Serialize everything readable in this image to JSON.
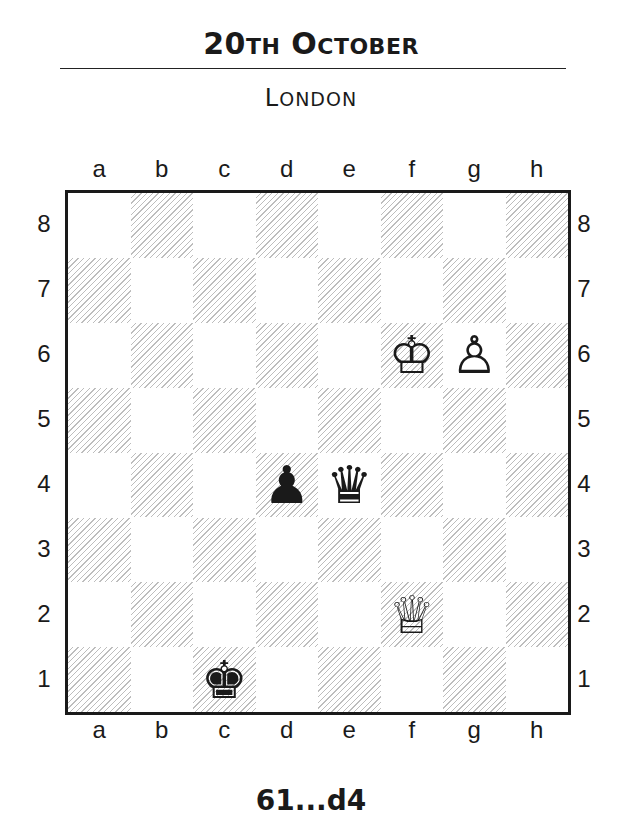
{
  "header": {
    "date_num": "20",
    "date_suffix": "TH",
    "month_first": "O",
    "month_rest": "CTOBER",
    "location_first": "L",
    "location_rest": "ONDON"
  },
  "board": {
    "files": [
      "a",
      "b",
      "c",
      "d",
      "e",
      "f",
      "g",
      "h"
    ],
    "ranks": [
      "8",
      "7",
      "6",
      "5",
      "4",
      "3",
      "2",
      "1"
    ],
    "pieces": [
      {
        "square": "f6",
        "piece": "white-king",
        "glyph": "♔"
      },
      {
        "square": "g6",
        "piece": "white-pawn",
        "glyph": "♙"
      },
      {
        "square": "d4",
        "piece": "black-pawn",
        "glyph": "♟"
      },
      {
        "square": "e4",
        "piece": "black-queen",
        "glyph": "♛"
      },
      {
        "square": "f2",
        "piece": "white-queen",
        "glyph": "♕"
      },
      {
        "square": "c1",
        "piece": "black-king",
        "glyph": "♚"
      }
    ]
  },
  "caption": {
    "move": "61...d4"
  }
}
